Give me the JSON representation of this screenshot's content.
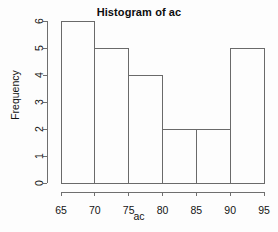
{
  "chart_data": {
    "type": "bar",
    "title": "Histogram of ac",
    "subtitle": "",
    "xlabel": "ac",
    "ylabel": "Frequency",
    "categories": [
      "65-70",
      "70-75",
      "75-80",
      "80-85",
      "85-90",
      "90-95"
    ],
    "bin_edges": [
      65,
      70,
      75,
      80,
      85,
      90,
      95
    ],
    "bin_width": 5,
    "values": [
      6,
      5,
      4,
      2,
      2,
      5
    ],
    "xticks": [
      65,
      70,
      75,
      80,
      85,
      90,
      95
    ],
    "xtick_labels": [
      "65",
      "70",
      "75",
      "80",
      "85",
      "90",
      "95"
    ],
    "yticks": [
      0,
      1,
      2,
      3,
      4,
      5,
      6
    ],
    "ytick_labels": [
      "0",
      "1",
      "2",
      "3",
      "4",
      "5",
      "6"
    ],
    "xlim": [
      65,
      95
    ],
    "ylim": [
      0,
      6
    ],
    "grid": false,
    "legend": false,
    "legend_position": "none",
    "bar_fill": "none",
    "bar_stroke": "#6a6a6a",
    "axis_color": "#6f6f6f",
    "text_color": "#141414",
    "background": "#fdfdfd",
    "tick_label_rotation_y": 90,
    "tick_label_rotation_x": 0
  }
}
